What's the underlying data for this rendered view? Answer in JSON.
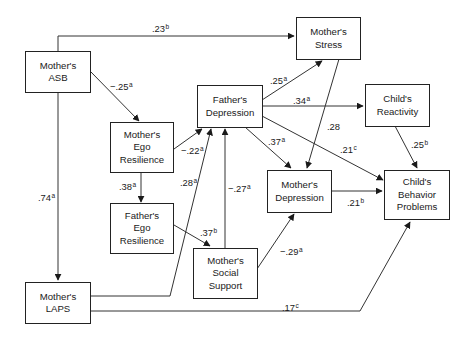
{
  "diagram": {
    "type": "path-model",
    "nodes": {
      "mothers_asb": {
        "lines": [
          "Mother's",
          "ASB"
        ]
      },
      "mothers_stress": {
        "lines": [
          "Mother's",
          "Stress"
        ]
      },
      "fathers_depression": {
        "lines": [
          "Father's",
          "Depression"
        ]
      },
      "childs_reactivity": {
        "lines": [
          "Child's",
          "Reactivity"
        ]
      },
      "mothers_ego_resilience": {
        "lines": [
          "Mother's",
          "Ego",
          "Resilience"
        ]
      },
      "mothers_depression": {
        "lines": [
          "Mother's",
          "Depression"
        ]
      },
      "childs_behavior_problems": {
        "lines": [
          "Child's",
          "Behavior",
          "Problems"
        ]
      },
      "fathers_ego_resilience": {
        "lines": [
          "Father's",
          "Ego",
          "Resilience"
        ]
      },
      "mothers_social_support": {
        "lines": [
          "Mother's",
          "Social",
          "Support"
        ]
      },
      "mothers_laps": {
        "lines": [
          "Mother's",
          "LAPS"
        ]
      }
    },
    "edges": [
      {
        "from": "Mother's ASB",
        "to": "Mother's Stress",
        "coef": ".23",
        "sig": "b"
      },
      {
        "from": "Mother's ASB",
        "to": "Mother's Ego Resilience",
        "coef": "−.25",
        "sig": "a"
      },
      {
        "from": "Mother's ASB",
        "to": "Mother's LAPS",
        "coef": ".74",
        "sig": "a"
      },
      {
        "from": "Mother's Ego Resilience",
        "to": "Father's Depression",
        "coef": "−.22",
        "sig": "a"
      },
      {
        "from": "Mother's Ego Resilience",
        "to": "Father's Ego Resilience",
        "coef": ".38",
        "sig": "a"
      },
      {
        "from": "Father's Ego Resilience",
        "to": "Mother's Social Support",
        "coef": ".37",
        "sig": "b"
      },
      {
        "from": "Mother's LAPS",
        "to": "Father's Depression",
        "coef": ".28",
        "sig": "a"
      },
      {
        "from": "Mother's Social Support",
        "to": "Father's Depression",
        "coef": "−.27",
        "sig": "a"
      },
      {
        "from": "Mother's Social Support",
        "to": "Mother's Depression",
        "coef": "−.29",
        "sig": "a"
      },
      {
        "from": "Father's Depression",
        "to": "Mother's Stress",
        "coef": ".25",
        "sig": "a"
      },
      {
        "from": "Father's Depression",
        "to": "Child's Reactivity",
        "coef": ".34",
        "sig": "a"
      },
      {
        "from": "Father's Depression",
        "to": "Mother's Depression",
        "coef": ".37",
        "sig": "a"
      },
      {
        "from": "Father's Depression",
        "to": "Child's Behavior Problems",
        "coef": ".21",
        "sig": "c"
      },
      {
        "from": "Mother's Stress",
        "to": "Mother's Depression",
        "coef": ".28",
        "sig": ""
      },
      {
        "from": "Child's Reactivity",
        "to": "Child's Behavior Problems",
        "coef": ".25",
        "sig": "b"
      },
      {
        "from": "Mother's Depression",
        "to": "Child's Behavior Problems",
        "coef": ".21",
        "sig": "b"
      },
      {
        "from": "Mother's LAPS",
        "to": "Child's Behavior Problems",
        "coef": ".17",
        "sig": "c"
      }
    ]
  }
}
